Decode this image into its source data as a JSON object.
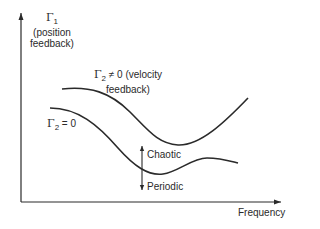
{
  "diagram": {
    "type": "stability-boundary-sketch",
    "y_axis": {
      "symbol": "Γ",
      "subscript": "1",
      "label_line1": "(position",
      "label_line2": "feedback)"
    },
    "x_axis": {
      "label": "Frequency"
    },
    "curves": [
      {
        "name": "velocity-feedback",
        "symbol": "Γ",
        "subscript": "2",
        "relation": " ≠ 0 (velocity",
        "label_line2": "feedback)"
      },
      {
        "name": "no-velocity-feedback",
        "symbol": "Γ",
        "subscript": "2",
        "relation": " = 0"
      }
    ],
    "regions": {
      "above": "Chaotic",
      "below": "Periodic"
    },
    "colors": {
      "ink": "#2a2a2a",
      "background": "#ffffff"
    }
  }
}
